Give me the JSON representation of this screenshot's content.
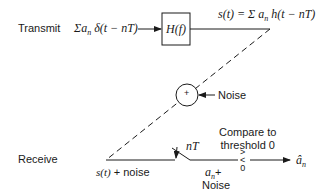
{
  "diagram": {
    "type": "block-diagram",
    "rows": {
      "transmit_label": "Transmit",
      "receive_label": "Receive"
    },
    "transmit": {
      "input_expr_sum": "Σ",
      "input_expr_a": "a",
      "input_expr_n": "n",
      "input_expr_rest": " δ(t − nT)",
      "filter_label": "H(f)",
      "output_expr_lhs": "s(t) = Σ ",
      "output_expr_a": "a",
      "output_expr_n": "n",
      "output_expr_rest": " h(t − nT)"
    },
    "channel": {
      "adder_symbol": "+",
      "noise_label": "Noise"
    },
    "receive": {
      "input_label": "s(t) + noise",
      "sampler_label": "nT",
      "sample_a": "a",
      "sample_n": "n",
      "sample_plus": "+",
      "sample_noise": "Noise",
      "comparator_symbol_top": ">",
      "comparator_symbol_mid": "<",
      "comparator_symbol_bot": "0",
      "compare_line1": "Compare to",
      "compare_line2": "threshold 0",
      "output_hat_a": "â",
      "output_n": "n"
    }
  }
}
